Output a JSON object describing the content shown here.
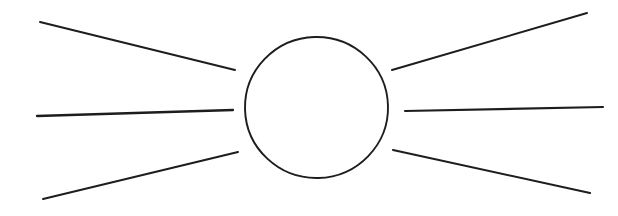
{
  "canvas": {
    "width": 618,
    "height": 216,
    "background_color": "#ffffff"
  },
  "diagram": {
    "name": "scattering-blob-diagram",
    "stroke_color": "#1d1d1d",
    "blob": {
      "label": "central-blob",
      "shape": "ellipse",
      "cx": 316.5,
      "cy": 107.5,
      "rx": 71.5,
      "ry": 70.5,
      "stroke_width": 1.9,
      "rotation_deg": -1.5,
      "path": "M 316.5 37.0 C 355.8 37.0 388.0 68.5 388.0 107.5 C 388.0 146.5 355.8 178.0 316.5 178.0 C 277.2 178.0 245.0 146.5 245.0 107.5 C 245.0 68.5 277.2 37.0 316.5 37.0 Z"
    },
    "legs": [
      {
        "label": "incoming-leg-upper-left",
        "side": "left",
        "position": "upper",
        "x1": 40,
        "y1": 22,
        "x2": 235,
        "y2": 70,
        "stroke_width": 2.0
      },
      {
        "label": "incoming-leg-middle-left",
        "side": "left",
        "position": "middle",
        "x1": 37,
        "y1": 116,
        "x2": 233,
        "y2": 110,
        "stroke_width": 2.3
      },
      {
        "label": "incoming-leg-lower-left",
        "side": "left",
        "position": "lower",
        "x1": 43,
        "y1": 199,
        "x2": 238,
        "y2": 152,
        "stroke_width": 2.0
      },
      {
        "label": "outgoing-leg-upper-right",
        "side": "right",
        "position": "upper",
        "x1": 392,
        "y1": 70,
        "x2": 587,
        "y2": 13,
        "stroke_width": 2.0
      },
      {
        "label": "outgoing-leg-middle-right",
        "side": "right",
        "position": "middle",
        "x1": 405,
        "y1": 111,
        "x2": 603,
        "y2": 107,
        "stroke_width": 2.1
      },
      {
        "label": "outgoing-leg-lower-right",
        "side": "right",
        "position": "lower",
        "x1": 393,
        "y1": 150,
        "x2": 590,
        "y2": 193,
        "stroke_width": 2.1
      }
    ]
  }
}
